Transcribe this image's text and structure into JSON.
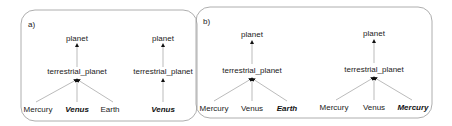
{
  "panels": [
    {
      "label": "a)",
      "trees": [
        {
          "root": "planet",
          "mid": "terrestrial_planet",
          "leaves": [
            "Mercury",
            "Venus",
            "Earth"
          ],
          "highlighted": "Venus"
        },
        {
          "root": "planet",
          "mid": "terrestrial_planet",
          "leaves": [
            "Venus"
          ],
          "highlighted": "Venus"
        }
      ]
    },
    {
      "label": "b)",
      "trees": [
        {
          "root": "planet",
          "mid": "terrestrial_planet",
          "leaves": [
            "Mercury",
            "Venus",
            "Earth"
          ],
          "highlighted": "Earth"
        },
        {
          "root": "planet",
          "mid": "terrestrial_planet",
          "leaves": [
            "Mercury",
            "Venus",
            "Mercury"
          ],
          "highlighted": "Mercury (3rd)"
        }
      ]
    }
  ],
  "text": {
    "a_label": "a)",
    "b_label": "b)",
    "t1_root": "planet",
    "t1_mid": "terrestrial_planet",
    "t1_l1": "Mercury",
    "t1_l2": "Venus",
    "t1_l3": "Earth",
    "t2_root": "planet",
    "t2_mid": "terrestrial_planet",
    "t2_l1": "Venus",
    "t3_root": "planet",
    "t3_mid": "terrestrial_planet",
    "t3_l1": "Mercury",
    "t3_l2": "Venus",
    "t3_l3": "Earth",
    "t4_root": "planet",
    "t4_mid": "terrestrial_planet",
    "t4_l1": "Mercury",
    "t4_l2": "Venus",
    "t4_l3": "Mercury"
  }
}
